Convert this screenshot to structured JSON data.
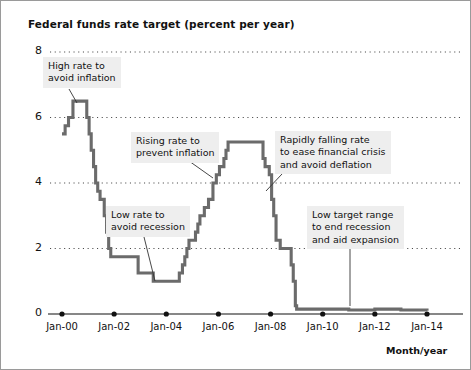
{
  "chart_data": {
    "type": "line",
    "title": "Federal funds rate target (percent per year)",
    "xlabel": "Month/year",
    "ylabel": "",
    "ylim": [
      0,
      8
    ],
    "yticks": [
      0,
      2,
      4,
      6,
      8
    ],
    "ytick_labels": [
      "0",
      "2",
      "4",
      "6",
      "8"
    ],
    "xlim": [
      2000.0,
      2014.0
    ],
    "xticks": [
      2000,
      2002,
      2004,
      2006,
      2008,
      2010,
      2012,
      2014
    ],
    "xtick_labels": [
      "Jan-00",
      "Jan-02",
      "Jan-04",
      "Jan-06",
      "Jan-08",
      "Jan-10",
      "Jan-12",
      "Jan-14"
    ],
    "grid": "horizontal-dotted",
    "legend": "none",
    "line_color": "#6b6b6b",
    "grid_color": "#4a4a4a",
    "series": [
      {
        "name": "Federal funds rate target",
        "step": "post",
        "x": [
          2000.0,
          2000.12,
          2000.25,
          2000.42,
          2000.95,
          2001.04,
          2001.12,
          2001.21,
          2001.29,
          2001.37,
          2001.46,
          2001.62,
          2001.71,
          2001.79,
          2001.87,
          2001.95,
          2002.92,
          2003.5,
          2004.5,
          2004.62,
          2004.71,
          2004.79,
          2004.87,
          2004.95,
          2005.12,
          2005.21,
          2005.29,
          2005.46,
          2005.62,
          2005.79,
          2005.92,
          2006.04,
          2006.21,
          2006.29,
          2006.37,
          2006.46,
          2007.71,
          2007.79,
          2007.95,
          2008.04,
          2008.12,
          2008.21,
          2008.37,
          2008.79,
          2008.87,
          2008.95,
          2009.0,
          2010.0,
          2011.0,
          2012.0,
          2013.0,
          2014.0
        ],
        "y": [
          5.5,
          5.75,
          6.0,
          6.5,
          6.0,
          5.5,
          5.0,
          4.5,
          4.0,
          3.75,
          3.5,
          3.0,
          2.5,
          2.0,
          1.75,
          1.75,
          1.25,
          1.0,
          1.25,
          1.5,
          1.75,
          2.0,
          2.25,
          2.25,
          2.5,
          2.75,
          3.0,
          3.25,
          3.5,
          4.0,
          4.25,
          4.5,
          4.75,
          5.0,
          5.25,
          5.25,
          4.75,
          4.5,
          4.25,
          3.5,
          3.0,
          2.25,
          2.0,
          1.5,
          1.0,
          0.25,
          0.15,
          0.15,
          0.12,
          0.15,
          0.12,
          0.1
        ]
      }
    ],
    "annotations": [
      {
        "id": "high-rate",
        "lines": [
          "High rate to",
          "avoid inflation"
        ],
        "box_x": 42,
        "box_y": 56,
        "leader_from_x": 68,
        "leader_from_y": 88,
        "leader_to_x": 76,
        "leader_to_y": 102
      },
      {
        "id": "rising-rate",
        "lines": [
          "Rising rate to",
          "prevent inflation"
        ],
        "box_x": 130,
        "box_y": 131,
        "leader_from_x": 188,
        "leader_from_y": 160,
        "leader_to_x": 212,
        "leader_to_y": 177
      },
      {
        "id": "low-rate",
        "lines": [
          "Low rate to",
          "avoid recession"
        ],
        "box_x": 105,
        "box_y": 205,
        "leader_from_x": 143,
        "leader_from_y": 236,
        "leader_to_x": 154,
        "leader_to_y": 280
      },
      {
        "id": "falling-rate",
        "lines": [
          "Rapidly falling rate",
          "to ease financial crisis",
          "and avoid deflation"
        ],
        "box_x": 274,
        "box_y": 130,
        "leader_from_x": 281,
        "leader_from_y": 173,
        "leader_to_x": 265,
        "leader_to_y": 190
      },
      {
        "id": "low-target-range",
        "lines": [
          "Low target range",
          "to end recession",
          "and aid expansion"
        ],
        "box_x": 306,
        "box_y": 205,
        "leader_from_x": 349,
        "leader_from_y": 246,
        "leader_to_x": 349,
        "leader_to_y": 305
      }
    ]
  }
}
